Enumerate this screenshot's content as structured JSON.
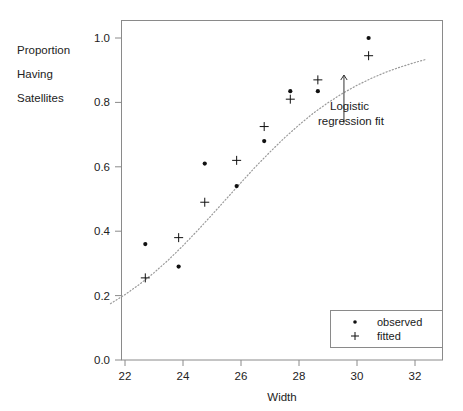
{
  "chart_data": {
    "type": "scatter",
    "title": "",
    "xlabel": "Width",
    "ylabel_lines": [
      "Proportion",
      "Having",
      "Satellites"
    ],
    "xlim": [
      21.5,
      32.4
    ],
    "ylim": [
      0.0,
      1.06
    ],
    "xticks": [
      22,
      24,
      26,
      28,
      30,
      32
    ],
    "xtick_labels": [
      "22",
      "24",
      "26",
      "28",
      "30",
      "32"
    ],
    "yticks": [
      0.0,
      0.2,
      0.4,
      0.6,
      0.8,
      1.0
    ],
    "ytick_labels": [
      "0.0",
      "0.2",
      "0.4",
      "0.6",
      "0.8",
      "1.0"
    ],
    "grid": false,
    "legend_position": "bottom-right",
    "series": [
      {
        "name": "observed",
        "marker": "dot",
        "x": [
          22.7,
          23.85,
          24.75,
          25.85,
          26.8,
          27.7,
          28.65,
          30.4
        ],
        "values": [
          0.36,
          0.29,
          0.61,
          0.54,
          0.68,
          0.835,
          0.835,
          1.0
        ]
      },
      {
        "name": "fitted",
        "marker": "plus",
        "x": [
          22.7,
          23.85,
          24.75,
          25.85,
          26.8,
          27.7,
          28.65,
          30.4
        ],
        "values": [
          0.255,
          0.38,
          0.49,
          0.62,
          0.725,
          0.81,
          0.87,
          0.945
        ]
      }
    ],
    "curve": {
      "name": "logistic regression fit",
      "style": "dotted",
      "x": [
        21.5,
        22.0,
        22.5,
        23.0,
        23.5,
        24.0,
        24.5,
        25.0,
        25.5,
        26.0,
        26.5,
        27.0,
        27.5,
        28.0,
        28.5,
        29.0,
        29.5,
        30.0,
        30.5,
        31.0,
        31.5,
        32.0,
        32.4
      ],
      "y": [
        0.175,
        0.203,
        0.235,
        0.271,
        0.311,
        0.355,
        0.402,
        0.451,
        0.501,
        0.551,
        0.6,
        0.646,
        0.69,
        0.73,
        0.767,
        0.799,
        0.828,
        0.853,
        0.875,
        0.894,
        0.91,
        0.924,
        0.934
      ]
    },
    "annotations": [
      {
        "name": "logistic-regression-fit-annotation",
        "text_lines": [
          "Logistic",
          "regression fit"
        ],
        "arrow": {
          "from_x": 29.55,
          "from_y": 0.735,
          "to_x": 29.55,
          "to_y": 0.885
        }
      }
    ],
    "legend_entries": [
      {
        "label": "observed",
        "marker": "dot"
      },
      {
        "label": "fitted",
        "marker": "plus"
      }
    ],
    "colors": {
      "axis": "#888888",
      "frame": "#8a8a8a",
      "marker": "#111111",
      "curve": "#999999",
      "text": "#1a1a1a",
      "background": "#ffffff"
    }
  }
}
